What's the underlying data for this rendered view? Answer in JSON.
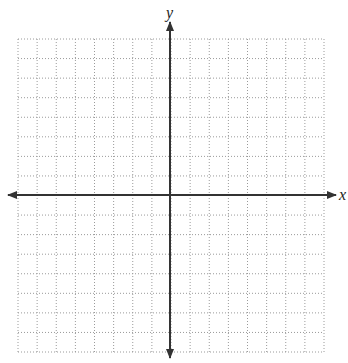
{
  "diagram": {
    "type": "coordinate-plane",
    "x_axis_label": "x",
    "y_axis_label": "y",
    "grid": {
      "columns": 16,
      "rows": 16,
      "style": "dotted",
      "color": "#9a9a9a"
    },
    "axis_color": "#333333",
    "arrows": [
      "left",
      "right",
      "up",
      "down"
    ]
  }
}
